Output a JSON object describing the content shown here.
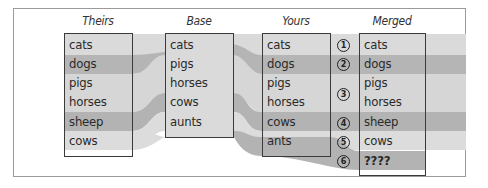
{
  "columns": [
    {
      "title": "Theirs",
      "rows": [
        "cats",
        "dogs",
        "pigs",
        "horses",
        "sheep",
        "cows"
      ]
    },
    {
      "title": "Base",
      "rows": [
        "cats",
        "pigs",
        "horses",
        "cows",
        "aunts"
      ]
    },
    {
      "title": "Yours",
      "rows": [
        "cats",
        "dogs",
        "pigs",
        "horses",
        "cows",
        "ants"
      ]
    },
    {
      "title": "Merged",
      "rows": [
        "cats",
        "dogs",
        "pigs",
        "horses",
        "sheep",
        "cows",
        "????"
      ]
    }
  ],
  "markers": [
    "1",
    "2",
    "3",
    "4",
    "5",
    "6"
  ],
  "colors": {
    "light_band": "#d9d9d9",
    "dark_band": "#b3b3b3",
    "box_border": "#3a3a3a",
    "frame_border": "#9a9a9a"
  }
}
